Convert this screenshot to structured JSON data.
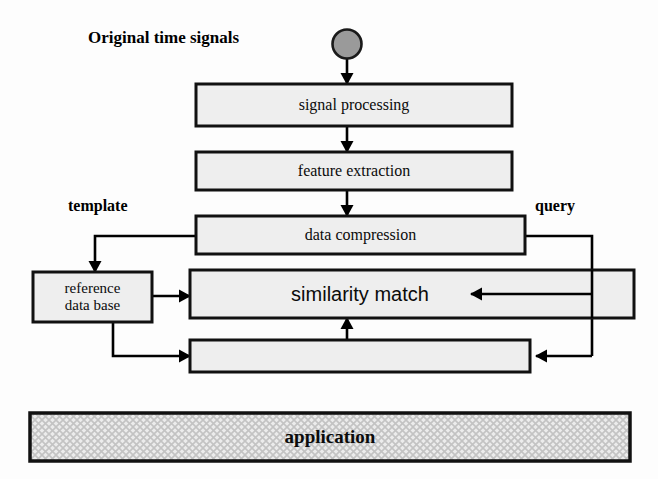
{
  "diagram": {
    "title_label": "Original time signals",
    "side_labels": {
      "left": "template",
      "right": "query"
    },
    "nodes": [
      {
        "id": "source",
        "label": "",
        "shape": "circle"
      },
      {
        "id": "signal-processing",
        "label": "signal processing",
        "shape": "rect"
      },
      {
        "id": "feature-extraction",
        "label": "feature extraction",
        "shape": "rect"
      },
      {
        "id": "data-compression",
        "label": "data compression",
        "shape": "rect"
      },
      {
        "id": "reference-data-base",
        "label": "reference\ndata base",
        "shape": "rect"
      },
      {
        "id": "similarity-match",
        "label": "similarity match",
        "shape": "rect"
      },
      {
        "id": "unlabeled-stage",
        "label": "",
        "shape": "rect"
      },
      {
        "id": "application",
        "label": "application",
        "shape": "rect-hatched"
      }
    ],
    "node_text": {
      "signal_processing": "signal processing",
      "feature_extraction": "feature extraction",
      "data_compression": "data compression",
      "reference_line1": "reference",
      "reference_line2": "data base",
      "similarity_match": "similarity match",
      "unlabeled_stage": "",
      "application": "application"
    },
    "colors": {
      "box_fill": "#eeeeee",
      "box_stroke": "#111111",
      "circle_fill": "#9a9a9a",
      "circle_stroke": "#1a1a1a",
      "arrow": "#000000",
      "hatch_fill": "#e9e9e9",
      "hatch_line": "#bcbcbc",
      "page_bg": "#fdfdfd",
      "text": "#0b0b0b"
    }
  }
}
